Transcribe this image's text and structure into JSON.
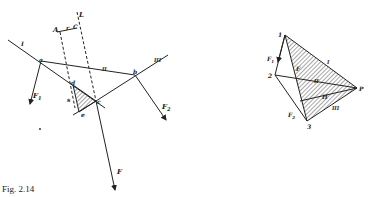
{
  "caption": "Fig. 2.14",
  "left_diagram": {
    "labels": {
      "L": "L",
      "A": "A",
      "r": "r",
      "C": "C",
      "I": "I",
      "II": "II",
      "III": "III",
      "a": "a",
      "b": "b",
      "c": "c",
      "d": "d",
      "e": "e",
      "s": "s",
      "F": "F",
      "F1": "F",
      "F1_sub": "1",
      "F2": "F",
      "F2_sub": "2"
    }
  },
  "right_diagram": {
    "labels": {
      "p1": "1",
      "p2": "2",
      "p3": "3",
      "P": "P",
      "F": "F",
      "H": "H",
      "I": "I",
      "II": "II",
      "III": "III",
      "F1": "F",
      "F1_sub": "1",
      "F3": "F",
      "F3_sub": "2"
    }
  },
  "colors": {
    "ink": "#222222",
    "background": "#ffffff"
  }
}
